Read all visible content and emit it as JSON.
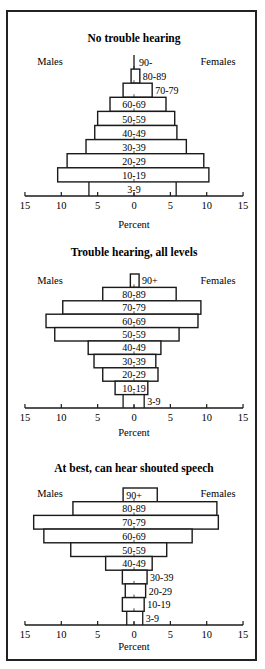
{
  "chart_data": [
    {
      "type": "bar",
      "orientation": "horizontal-population-pyramid",
      "title": "No trouble hearing",
      "xlabel": "Percent",
      "ylabel": "",
      "left_label": "Males",
      "right_label": "Females",
      "xlim": [
        -15,
        15
      ],
      "xticks": [
        15,
        10,
        5,
        0,
        5,
        10,
        15
      ],
      "categories": [
        "90-",
        "80-89",
        "70-79",
        "60-69",
        "50-59",
        "40-49",
        "30-39",
        "20-29",
        "10-19",
        "3-9"
      ],
      "series": [
        {
          "name": "Males",
          "values": [
            0.1,
            0.4,
            1.5,
            3.3,
            5.0,
            5.4,
            6.6,
            9.2,
            10.5,
            6.2
          ]
        },
        {
          "name": "Females",
          "values": [
            0.1,
            0.8,
            2.5,
            4.4,
            5.6,
            5.9,
            7.2,
            9.6,
            10.3,
            5.8
          ]
        }
      ],
      "label_outside": [
        "90-",
        "80-89",
        "70-79"
      ],
      "open_bottom": true,
      "grid": false
    },
    {
      "type": "bar",
      "orientation": "horizontal-population-pyramid",
      "title": "Trouble hearing, all levels",
      "xlabel": "Percent",
      "ylabel": "",
      "left_label": "Males",
      "right_label": "Females",
      "xlim": [
        -15,
        15
      ],
      "xticks": [
        15,
        10,
        5,
        0,
        5,
        10,
        15
      ],
      "categories": [
        "90+",
        "80-89",
        "70-79",
        "60-69",
        "50-59",
        "40-49",
        "30-39",
        "20-29",
        "10-19",
        "3-9"
      ],
      "series": [
        {
          "name": "Males",
          "values": [
            0.5,
            4.3,
            9.8,
            12.1,
            10.9,
            6.3,
            5.5,
            4.3,
            2.6,
            1.5
          ]
        },
        {
          "name": "Females",
          "values": [
            0.7,
            5.8,
            9.2,
            8.8,
            6.2,
            3.7,
            3.0,
            3.3,
            1.9,
            1.4
          ]
        }
      ],
      "label_outside": [
        "90+",
        "3-9"
      ],
      "open_bottom": true,
      "grid": false
    },
    {
      "type": "bar",
      "orientation": "horizontal-population-pyramid",
      "title": "At best, can hear shouted speech",
      "xlabel": "Percent",
      "ylabel": "",
      "left_label": "Males",
      "right_label": "Females",
      "xlim": [
        -15,
        15
      ],
      "xticks": [
        15,
        10,
        5,
        0,
        5,
        10,
        15
      ],
      "categories": [
        "90+",
        "80-89",
        "70-79",
        "60-69",
        "50-59",
        "40-49",
        "30-39",
        "20-29",
        "10-19",
        "3-9"
      ],
      "series": [
        {
          "name": "Males",
          "values": [
            1.5,
            8.4,
            13.8,
            12.4,
            8.7,
            3.9,
            1.6,
            1.2,
            1.6,
            1.0
          ]
        },
        {
          "name": "Females",
          "values": [
            3.2,
            11.4,
            11.6,
            8.0,
            4.5,
            2.5,
            1.8,
            1.6,
            1.4,
            1.2
          ]
        }
      ],
      "label_outside": [
        "30-39",
        "20-29",
        "10-19",
        "3-9"
      ],
      "open_bottom": true,
      "grid": false
    }
  ],
  "layout": {
    "panels": [
      {
        "title_y": 42,
        "side_y": 65,
        "bars_top": 55,
        "axis_y": 196,
        "percent_y": 228
      },
      {
        "title_y": 256,
        "side_y": 284,
        "bars_top": 274,
        "axis_y": 408,
        "percent_y": 436
      },
      {
        "title_y": 472,
        "side_y": 497,
        "bars_top": 488,
        "axis_y": 625,
        "percent_y": 650
      }
    ],
    "center_x": 134,
    "px_per_pct": 7.27,
    "colors": {
      "ink": "#1a1a1a",
      "bar_fill": "#ffffff",
      "background": "#ffffff"
    }
  }
}
